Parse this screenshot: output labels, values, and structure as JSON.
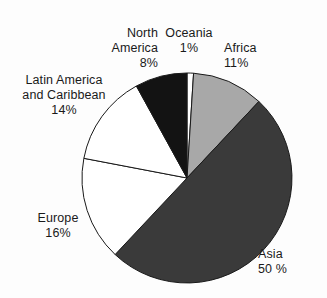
{
  "chart_data": {
    "type": "pie",
    "title": "",
    "subtitle": "",
    "xlabel": "",
    "ylabel": "",
    "legend_position": "none",
    "grid": false,
    "start_angle_deg": 0,
    "direction": "clockwise",
    "units": "percent",
    "categories": [
      "Oceania",
      "Africa",
      "Asia",
      "Europe",
      "Latin America and Caribbean",
      "North America"
    ],
    "values": [
      1,
      11,
      50,
      16,
      14,
      8
    ],
    "slices": [
      {
        "name": "oceania",
        "label": "Oceania",
        "value": 1,
        "value_text": "1%",
        "color": "#ffffff",
        "stroke": "#1a1a1a"
      },
      {
        "name": "africa",
        "label": "Africa",
        "value": 11,
        "value_text": "11%",
        "color": "#a8a8a8",
        "stroke": "#1a1a1a"
      },
      {
        "name": "asia",
        "label": "Asia",
        "value": 50,
        "value_text": "50 %",
        "color": "#3a3a3a",
        "stroke": "#1a1a1a"
      },
      {
        "name": "europe",
        "label": "Europe",
        "value": 16,
        "value_text": "16%",
        "color": "#ffffff",
        "stroke": "#1a1a1a"
      },
      {
        "name": "latin-america-and-caribbean",
        "label_line1": "Latin America",
        "label_line2": "and Caribbean",
        "label": "Latin America and Caribbean",
        "value": 14,
        "value_text": "14%",
        "color": "#ffffff",
        "stroke": "#1a1a1a"
      },
      {
        "name": "north-america",
        "label_line1": "North",
        "label_line2": "America",
        "label": "North America",
        "value": 8,
        "value_text": "8%",
        "color": "#131313",
        "stroke": "#1a1a1a"
      }
    ]
  },
  "colors": {
    "background": "#fdfdfd",
    "text": "#1a1a1a",
    "outline": "#1a1a1a",
    "africa_fill": "#a8a8a8",
    "asia_fill": "#3a3a3a",
    "north_america_fill": "#131313",
    "white_fill": "#ffffff"
  },
  "geometry": {
    "center_x": 187,
    "center_y": 178,
    "radius": 105
  }
}
